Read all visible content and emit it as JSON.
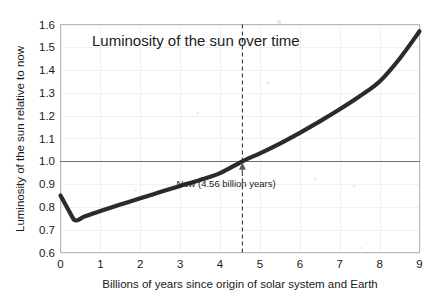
{
  "chart_data": {
    "type": "line",
    "title": "Luminosity of the sun over time",
    "xlabel": "Billions of years since origin of solar system and Earth",
    "ylabel": "Luminosity of the sun relative to now",
    "xlim": [
      0,
      9
    ],
    "ylim": [
      0.6,
      1.6
    ],
    "grid": true,
    "legend": "none",
    "x_ticks": [
      "0",
      "1",
      "2",
      "3",
      "4",
      "5",
      "6",
      "7",
      "8",
      "9"
    ],
    "y_ticks": [
      "0.6",
      "0.7",
      "0.8",
      "0.9",
      "1.0",
      "1.1",
      "1.2",
      "1.3",
      "1.4",
      "1.5",
      "1.6"
    ],
    "x": [
      0,
      0.33,
      0.6,
      1.0,
      1.5,
      2.0,
      2.5,
      3.0,
      3.5,
      4.0,
      4.56,
      5.0,
      5.5,
      6.0,
      6.5,
      7.0,
      7.5,
      8.0,
      8.5,
      9.0
    ],
    "series": [
      {
        "name": "Solar luminosity relative to present",
        "values": [
          0.85,
          0.745,
          0.758,
          0.782,
          0.81,
          0.838,
          0.865,
          0.892,
          0.918,
          0.948,
          1.0,
          1.035,
          1.078,
          1.125,
          1.175,
          1.228,
          1.285,
          1.35,
          1.45,
          1.57
        ]
      }
    ],
    "reference_lines": [
      {
        "name": "present-luminosity",
        "orientation": "horizontal",
        "value": 1.0,
        "style": "solid",
        "color": "#6e6e72"
      },
      {
        "name": "now-marker",
        "orientation": "vertical",
        "value": 4.56,
        "style": "dashed",
        "color": "#3a3a3a"
      }
    ],
    "annotations": [
      {
        "name": "now-annotation",
        "text": "Now (4.56 billion years)",
        "x": 4.56,
        "y": 0.9,
        "arrow_to": [
          4.56,
          1.0
        ]
      }
    ],
    "colors": {
      "curve": "#2b2b2b",
      "grid": "#f0f0f2",
      "border": "#b8b8bc",
      "reference": "#6e6e72",
      "background": "#ffffff"
    }
  }
}
